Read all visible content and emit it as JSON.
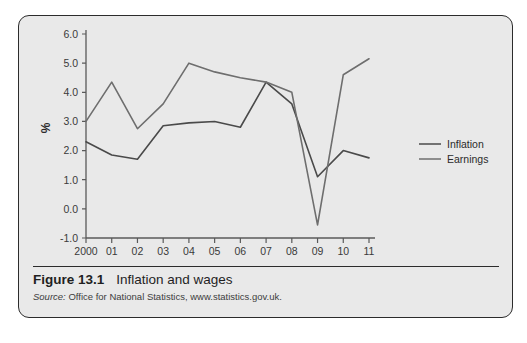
{
  "figure": {
    "number": "Figure 13.1",
    "title": "Inflation and wages",
    "source_label": "Source:",
    "source_text": "Office for National Statistics, www.statistics.gov.uk."
  },
  "colors": {
    "page_background": "#ffffff",
    "panel_background": "#e9e9e9",
    "panel_border": "#2c2c2c",
    "axis": "#5a5a5a",
    "inflation_line": "#4a4a4a",
    "earnings_line": "#6e6e6e",
    "text": "#2b2b2b"
  },
  "chart_data": {
    "type": "line",
    "title": "Inflation and wages",
    "xlabel": "",
    "ylabel": "%",
    "categories": [
      "2000",
      "01",
      "02",
      "03",
      "04",
      "05",
      "06",
      "07",
      "08",
      "09",
      "10",
      "11"
    ],
    "x": [
      2000,
      2001,
      2002,
      2003,
      2004,
      2005,
      2006,
      2007,
      2008,
      2009,
      2010,
      2011
    ],
    "ylim": [
      -1.0,
      6.0
    ],
    "yticks": [
      -1.0,
      0.0,
      1.0,
      2.0,
      3.0,
      4.0,
      5.0,
      6.0
    ],
    "ytick_labels": [
      "-1.0",
      "0.0",
      "1.0",
      "2.0",
      "3.0",
      "4.0",
      "5.0",
      "6.0"
    ],
    "grid": false,
    "legend_position": "right",
    "series": [
      {
        "name": "Inflation",
        "values": [
          2.3,
          1.85,
          1.7,
          2.85,
          2.95,
          3.0,
          2.8,
          4.35,
          3.6,
          1.1,
          2.0,
          1.75
        ]
      },
      {
        "name": "Earnings",
        "values": [
          3.0,
          4.35,
          2.75,
          3.6,
          5.0,
          4.7,
          4.5,
          4.35,
          4.0,
          -0.55,
          4.6,
          5.15
        ]
      }
    ]
  },
  "legend": {
    "items": [
      {
        "label": "Inflation"
      },
      {
        "label": "Earnings"
      }
    ]
  }
}
